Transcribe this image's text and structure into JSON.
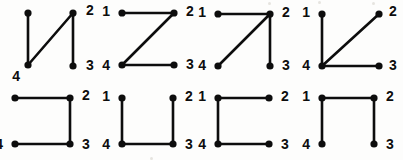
{
  "figure": {
    "canvas": {
      "width": 403,
      "height": 160
    },
    "ink_color": "#0d0d0d",
    "background_color": "#fdfdfc",
    "vertex_count_per_graph": 4,
    "labels": [
      "1",
      "2",
      "3",
      "4"
    ],
    "rows": 2,
    "columns": 4
  },
  "graphs": [
    {
      "id": "graph-1",
      "position": {
        "row": 1,
        "col": 1,
        "left": 0,
        "top": 0,
        "width": 95,
        "height": 80
      },
      "description": "path 1-4-2-3 with diagonal edge from 4 to 2",
      "edges": [
        [
          "1",
          "4"
        ],
        [
          "4",
          "2"
        ],
        [
          "2",
          "3"
        ]
      ],
      "vertices": [
        {
          "label": "1",
          "x": 28,
          "y": 13,
          "label_x": 14,
          "label_y": 13,
          "label_visible": false
        },
        {
          "label": "2",
          "x": 73,
          "y": 13,
          "label_x": 86,
          "label_y": 11,
          "label_visible": true
        },
        {
          "label": "3",
          "x": 73,
          "y": 66,
          "label_x": 86,
          "label_y": 66,
          "label_visible": true
        },
        {
          "label": "4",
          "x": 28,
          "y": 65,
          "label_x": 20,
          "label_y": 77,
          "label_visible": true
        }
      ]
    },
    {
      "id": "graph-2",
      "position": {
        "row": 1,
        "col": 2,
        "left": 100,
        "top": 0,
        "width": 95,
        "height": 80
      },
      "description": "Z shape: 1-2, 2-4 diagonal, 4-3",
      "edges": [
        [
          "1",
          "2"
        ],
        [
          "2",
          "4"
        ],
        [
          "4",
          "3"
        ]
      ],
      "vertices": [
        {
          "label": "1",
          "x": 22,
          "y": 13,
          "label_x": 10,
          "label_y": 12,
          "label_visible": true
        },
        {
          "label": "2",
          "x": 74,
          "y": 13,
          "label_x": 86,
          "label_y": 12,
          "label_visible": true
        },
        {
          "label": "3",
          "x": 74,
          "y": 65,
          "label_x": 86,
          "label_y": 65,
          "label_visible": true
        },
        {
          "label": "4",
          "x": 22,
          "y": 65,
          "label_x": 10,
          "label_y": 66,
          "label_visible": true
        }
      ]
    },
    {
      "id": "graph-3",
      "position": {
        "row": 1,
        "col": 3,
        "left": 196,
        "top": 0,
        "width": 95,
        "height": 80
      },
      "description": "star centred on vertex 2 joined to 1, 3 and 4",
      "edges": [
        [
          "1",
          "2"
        ],
        [
          "2",
          "3"
        ],
        [
          "2",
          "4"
        ]
      ],
      "vertices": [
        {
          "label": "1",
          "x": 22,
          "y": 14,
          "label_x": 10,
          "label_y": 13,
          "label_visible": true
        },
        {
          "label": "2",
          "x": 74,
          "y": 14,
          "label_x": 86,
          "label_y": 13,
          "label_visible": true
        },
        {
          "label": "3",
          "x": 74,
          "y": 66,
          "label_x": 86,
          "label_y": 66,
          "label_visible": true
        },
        {
          "label": "4",
          "x": 22,
          "y": 66,
          "label_x": 10,
          "label_y": 66,
          "label_visible": true
        }
      ]
    },
    {
      "id": "graph-4",
      "position": {
        "row": 1,
        "col": 4,
        "left": 294,
        "top": 0,
        "width": 100,
        "height": 80
      },
      "description": "star centred on vertex 4 joined to 1, 2 and 3",
      "edges": [
        [
          "4",
          "1"
        ],
        [
          "4",
          "2"
        ],
        [
          "4",
          "3"
        ]
      ],
      "vertices": [
        {
          "label": "1",
          "x": 28,
          "y": 14,
          "label_x": 16,
          "label_y": 13,
          "label_visible": true
        },
        {
          "label": "2",
          "x": 85,
          "y": 14,
          "label_x": 95,
          "label_y": 12,
          "label_visible": true
        },
        {
          "label": "3",
          "x": 85,
          "y": 66,
          "label_x": 95,
          "label_y": 66,
          "label_visible": true
        },
        {
          "label": "4",
          "x": 28,
          "y": 66,
          "label_x": 16,
          "label_y": 66,
          "label_visible": true
        }
      ]
    },
    {
      "id": "graph-5",
      "position": {
        "row": 2,
        "col": 1,
        "left": 0,
        "top": 82,
        "width": 95,
        "height": 78
      },
      "description": "path 1-2-3-4 forming an open square, left side missing",
      "edges": [
        [
          "1",
          "2"
        ],
        [
          "2",
          "3"
        ],
        [
          "3",
          "4"
        ]
      ],
      "vertices": [
        {
          "label": "1",
          "x": 15,
          "y": 16,
          "label_x": 2,
          "label_y": 15,
          "label_visible": false
        },
        {
          "label": "2",
          "x": 70,
          "y": 16,
          "label_x": 82,
          "label_y": 14,
          "label_visible": true
        },
        {
          "label": "3",
          "x": 70,
          "y": 62,
          "label_x": 82,
          "label_y": 63,
          "label_visible": true
        },
        {
          "label": "4",
          "x": 15,
          "y": 62,
          "label_x": 3,
          "label_y": 63,
          "label_visible": true
        }
      ]
    },
    {
      "id": "graph-6",
      "position": {
        "row": 2,
        "col": 2,
        "left": 100,
        "top": 82,
        "width": 95,
        "height": 78
      },
      "description": "U shape: path 1-4-3-2, top side missing",
      "edges": [
        [
          "1",
          "4"
        ],
        [
          "4",
          "3"
        ],
        [
          "3",
          "2"
        ]
      ],
      "vertices": [
        {
          "label": "1",
          "x": 22,
          "y": 16,
          "label_x": 10,
          "label_y": 15,
          "label_visible": true
        },
        {
          "label": "2",
          "x": 73,
          "y": 16,
          "label_x": 85,
          "label_y": 15,
          "label_visible": true
        },
        {
          "label": "3",
          "x": 73,
          "y": 62,
          "label_x": 85,
          "label_y": 63,
          "label_visible": true
        },
        {
          "label": "4",
          "x": 22,
          "y": 62,
          "label_x": 10,
          "label_y": 63,
          "label_visible": true
        }
      ]
    },
    {
      "id": "graph-7",
      "position": {
        "row": 2,
        "col": 3,
        "left": 196,
        "top": 82,
        "width": 95,
        "height": 78
      },
      "description": "path 2-1-4-3, right side missing",
      "edges": [
        [
          "2",
          "1"
        ],
        [
          "1",
          "4"
        ],
        [
          "4",
          "3"
        ]
      ],
      "vertices": [
        {
          "label": "1",
          "x": 22,
          "y": 16,
          "label_x": 10,
          "label_y": 15,
          "label_visible": true
        },
        {
          "label": "2",
          "x": 73,
          "y": 16,
          "label_x": 85,
          "label_y": 15,
          "label_visible": true
        },
        {
          "label": "3",
          "x": 73,
          "y": 62,
          "label_x": 85,
          "label_y": 63,
          "label_visible": true
        },
        {
          "label": "4",
          "x": 22,
          "y": 62,
          "label_x": 10,
          "label_y": 63,
          "label_visible": true
        }
      ]
    },
    {
      "id": "graph-8",
      "position": {
        "row": 2,
        "col": 4,
        "left": 294,
        "top": 82,
        "width": 100,
        "height": 78
      },
      "description": "path 4-1-2-3, bottom side missing",
      "edges": [
        [
          "4",
          "1"
        ],
        [
          "1",
          "2"
        ],
        [
          "2",
          "3"
        ]
      ],
      "vertices": [
        {
          "label": "1",
          "x": 28,
          "y": 16,
          "label_x": 16,
          "label_y": 15,
          "label_visible": true
        },
        {
          "label": "2",
          "x": 80,
          "y": 16,
          "label_x": 92,
          "label_y": 15,
          "label_visible": true
        },
        {
          "label": "3",
          "x": 80,
          "y": 62,
          "label_x": 92,
          "label_y": 63,
          "label_visible": true
        },
        {
          "label": "4",
          "x": 28,
          "y": 62,
          "label_x": 16,
          "label_y": 63,
          "label_visible": true
        }
      ]
    }
  ],
  "scan_artifacts": [
    {
      "left": 268,
      "top": 2,
      "size": 3
    },
    {
      "left": 318,
      "top": 1,
      "size": 3
    },
    {
      "left": 372,
      "top": 2,
      "size": 3
    },
    {
      "left": 150,
      "top": 157,
      "size": 3
    }
  ]
}
